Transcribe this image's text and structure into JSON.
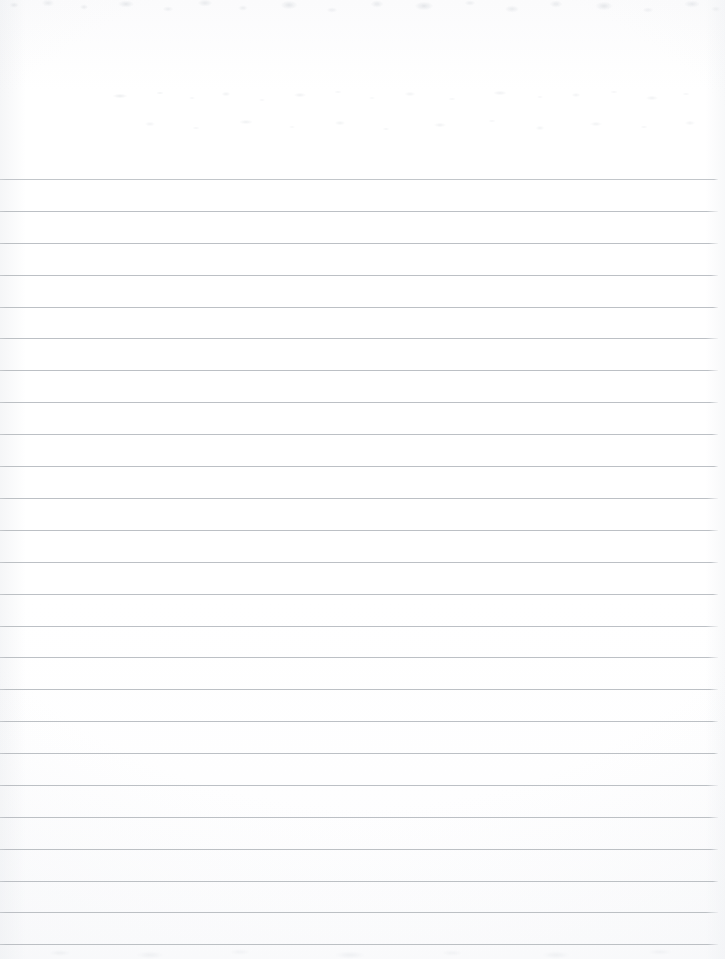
{
  "document": {
    "kind": "scanned-lined-paper",
    "title": "Blank ruled notebook page",
    "page_width": 725,
    "page_height": 959,
    "content_text": "",
    "has_handwriting": false,
    "has_printed_text": false,
    "notes": "Blank wide-ruled sheet, scanned. Top margin area is unruled. Faint bleed-through ghost marks and scanner noise along top edge."
  },
  "colors": {
    "paper": "#ffffff",
    "rule_line": "#b9bdc2",
    "rule_line_faint": "#c6cacf",
    "edge_shadow": "#ebeef1"
  },
  "ruling": {
    "style": "wide-ruled",
    "line_count": 25,
    "first_line_y": 179,
    "last_line_y": 944,
    "line_spacing": 31.9,
    "line_thickness": 1,
    "line_start_x": 0,
    "line_end_x": 718,
    "margin_rule": "none",
    "top_margin_height": 179,
    "lines_y": [
      179,
      211,
      243,
      275,
      307,
      338,
      370,
      402,
      434,
      466,
      498,
      530,
      562,
      594,
      626,
      657,
      689,
      721,
      753,
      785,
      817,
      849,
      881,
      912,
      944
    ],
    "line_opacity": [
      0.86,
      0.95,
      0.95,
      0.95,
      0.95,
      0.95,
      0.95,
      0.95,
      0.95,
      0.95,
      0.95,
      0.95,
      0.95,
      0.95,
      0.95,
      0.95,
      0.95,
      0.95,
      0.95,
      0.95,
      0.95,
      0.95,
      0.95,
      0.95,
      0.95
    ]
  }
}
